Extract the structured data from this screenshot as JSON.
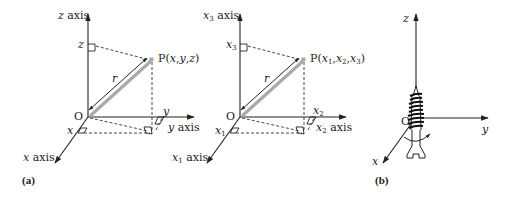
{
  "figure": {
    "panels": [
      {
        "id": "a",
        "panel_label": "(a)",
        "axes": {
          "z": "z axis",
          "y": "y axis",
          "x": "x axis"
        },
        "origin": "O",
        "point": "P(x,y,z)",
        "radius_label": "r",
        "ticks": {
          "z": "z",
          "y": "y",
          "x": "x"
        }
      },
      {
        "id": "a2",
        "axes": {
          "x3": "x₃ axis",
          "x2": "x₂ axis",
          "x1": "x₁ axis"
        },
        "axes_parts": {
          "x3": {
            "var": "x",
            "sub": "3",
            "suffix": " axis"
          },
          "x2": {
            "var": "x",
            "sub": "2",
            "suffix": " axis"
          },
          "x1": {
            "var": "x",
            "sub": "1",
            "suffix": " axis"
          }
        },
        "origin": "O",
        "point": "P(x₁,x₂,x₃)",
        "radius_label": "r",
        "ticks": {
          "x3": {
            "var": "x",
            "sub": "3"
          },
          "x2": {
            "var": "x",
            "sub": "2"
          },
          "x1": {
            "var": "x",
            "sub": "1"
          }
        }
      },
      {
        "id": "b",
        "panel_label": "(b)",
        "axes": {
          "z": "z",
          "y": "y",
          "x": "x"
        },
        "origin": "O",
        "illustration": "right-hand-screw"
      }
    ]
  }
}
